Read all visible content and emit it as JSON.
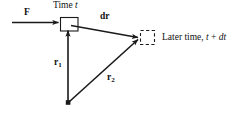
{
  "figure": {
    "width": 238,
    "height": 114,
    "background_color": "#ffffff",
    "stroke_color": "#1a1a1a",
    "type": "vector-displacement-diagram"
  },
  "labels": {
    "force": "F",
    "time_initial": "Time",
    "time_initial_var": "t",
    "displacement": "dr",
    "position_1": "r",
    "position_1_sub": "1",
    "position_2": "r",
    "position_2_sub": "2",
    "later_time_text": "Later time,",
    "later_time_expr_a": "t",
    "later_time_plus": "+",
    "later_time_expr_b": "dt"
  },
  "geometry": {
    "origin_point": {
      "x": 68,
      "y": 103
    },
    "particle_box": {
      "x": 60,
      "y": 17,
      "width": 18,
      "height": 14,
      "style": "solid"
    },
    "later_box": {
      "x": 140,
      "y": 30,
      "width": 15,
      "height": 15,
      "style": "dashed"
    },
    "force_arrow": {
      "x1": 12,
      "y1": 22,
      "x2": 59,
      "y2": 22
    },
    "dr_arrow": {
      "x1": 72,
      "y1": 26,
      "x2": 139,
      "y2": 38
    },
    "r1_arrow": {
      "x1": 68,
      "y1": 101,
      "x2": 68,
      "y2": 31
    },
    "r2_arrow": {
      "x1": 70,
      "y1": 101,
      "x2": 139,
      "y2": 40
    }
  },
  "colors": {
    "ink": "#1a1a1a",
    "paper": "#ffffff"
  }
}
